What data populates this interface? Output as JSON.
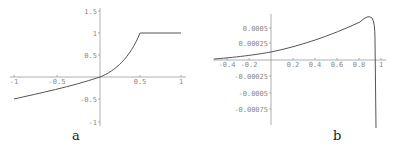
{
  "chart_data": [
    {
      "type": "line",
      "panel_label": "a",
      "xlim": [
        -1,
        1
      ],
      "ylim": [
        -1,
        1.5
      ],
      "x_ticks": [
        "-1",
        "-0.5",
        "0.5",
        "1"
      ],
      "y_ticks": [
        "1.5",
        "1",
        "0.5",
        "-0.5",
        "-1"
      ],
      "series": [
        {
          "name": "curve",
          "x": [
            -1,
            -0.75,
            -0.5,
            -0.25,
            0,
            0.1,
            0.2,
            0.3,
            0.4,
            0.5,
            0.75,
            1
          ],
          "y": [
            -0.5,
            -0.4,
            -0.3,
            -0.17,
            0,
            0.11,
            0.25,
            0.42,
            0.66,
            1,
            1,
            1
          ]
        }
      ],
      "grid": false
    },
    {
      "type": "line",
      "panel_label": "b",
      "xlim": [
        -0.5,
        1.0
      ],
      "ylim": [
        -0.0009,
        0.0007
      ],
      "x_ticks": [
        "-0.4",
        "-0.2",
        "0.2",
        "0.4",
        "0.6",
        "0.8",
        "1"
      ],
      "y_ticks": [
        "0.0005",
        "0.00025",
        "-0.00025",
        "-0.0005",
        "-0.00075"
      ],
      "series": [
        {
          "name": "curve",
          "x": [
            -0.5,
            -0.3,
            -0.1,
            0,
            0.2,
            0.4,
            0.6,
            0.8,
            0.9,
            0.93,
            0.95,
            0.96
          ],
          "y": [
            2e-05,
            5e-05,
            0.0001,
            0.00013,
            0.0002,
            0.0003,
            0.00042,
            0.0006,
            0.00068,
            0.0007,
            0.0004,
            -0.0009
          ]
        }
      ],
      "grid": false
    }
  ],
  "labels": {
    "a": "a",
    "b": "b"
  },
  "plot_a": {
    "x_ticks": [
      {
        "label": "-1",
        "x": 14
      },
      {
        "label": "-0.5",
        "x": 57
      },
      {
        "label": "0.5",
        "x": 140
      },
      {
        "label": "1",
        "x": 181
      }
    ],
    "y_ticks": [
      {
        "label": "1.5",
        "y": 11
      },
      {
        "label": "1",
        "y": 33
      },
      {
        "label": "0.5",
        "y": 55
      },
      {
        "label": "-0.5",
        "y": 99
      },
      {
        "label": "-1",
        "y": 122
      }
    ]
  },
  "plot_b": {
    "x_ticks": [
      {
        "label": "-0.4",
        "x": 227
      },
      {
        "label": "-0.2",
        "x": 249
      },
      {
        "label": "0.2",
        "x": 293
      },
      {
        "label": "0.4",
        "x": 315
      },
      {
        "label": "0.6",
        "x": 337
      },
      {
        "label": "0.8",
        "x": 359
      },
      {
        "label": "1",
        "x": 381
      }
    ],
    "y_ticks": [
      {
        "label": "0.0005",
        "y": 28
      },
      {
        "label": "0.00025",
        "y": 43
      },
      {
        "label": "-0.00025",
        "y": 76
      },
      {
        "label": "-0.0005",
        "y": 93
      },
      {
        "label": "-0.00075",
        "y": 109
      }
    ]
  }
}
